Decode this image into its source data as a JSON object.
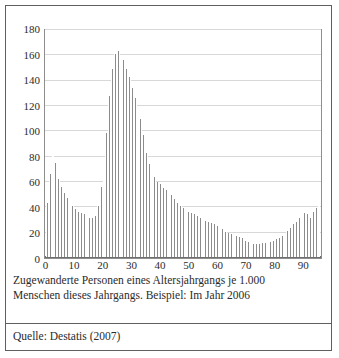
{
  "figure": {
    "caption_lines": [
      "Zugewanderte Personen eines Altersjahrgangs je 1.000",
      "Menschen dieses Jahrgangs. Beispiel: Im Jahr 2006"
    ],
    "source": "Quelle: Destatis (2007)"
  },
  "colors": {
    "bar_fill": "#8c8c8c",
    "grid": "#d8d8d8",
    "frame": "#8e8e8e",
    "outer_border": "#5f5f5f",
    "text": "#2b2b2b",
    "background": "#ffffff"
  },
  "chart_data": {
    "type": "bar",
    "title": "",
    "subtitle": "",
    "xlabel": "",
    "ylabel": "",
    "xlim": [
      -1,
      97
    ],
    "ylim": [
      0,
      180
    ],
    "grid": true,
    "legend": "none",
    "y_ticks": [
      0,
      20,
      40,
      60,
      80,
      100,
      120,
      140,
      160,
      180
    ],
    "x_ticks": [
      0,
      10,
      20,
      30,
      40,
      50,
      60,
      70,
      80,
      90
    ],
    "annotations": [],
    "categories": [
      0,
      1,
      2,
      3,
      4,
      5,
      6,
      7,
      8,
      9,
      10,
      11,
      12,
      13,
      14,
      15,
      16,
      17,
      18,
      19,
      20,
      21,
      22,
      23,
      24,
      25,
      26,
      27,
      28,
      29,
      30,
      31,
      32,
      33,
      34,
      35,
      36,
      37,
      38,
      39,
      40,
      41,
      42,
      43,
      44,
      45,
      46,
      47,
      48,
      49,
      50,
      51,
      52,
      53,
      54,
      55,
      56,
      57,
      58,
      59,
      60,
      61,
      62,
      63,
      64,
      65,
      66,
      67,
      68,
      69,
      70,
      71,
      72,
      73,
      74,
      75,
      76,
      77,
      78,
      79,
      80,
      81,
      82,
      83,
      84,
      85,
      86,
      87,
      88,
      89,
      90,
      91,
      92,
      93,
      94,
      95,
      96
    ],
    "values": [
      43,
      66,
      86,
      75,
      62,
      56,
      51,
      47,
      44,
      41,
      38,
      36,
      35,
      34,
      32,
      31,
      31,
      33,
      41,
      56,
      62,
      99,
      128,
      150,
      162,
      164,
      160,
      157,
      150,
      143,
      135,
      127,
      120,
      110,
      97,
      83,
      74,
      68,
      64,
      60,
      58,
      55,
      53,
      51,
      49,
      46,
      43,
      41,
      39,
      38,
      36,
      35,
      34,
      33,
      31,
      30,
      29,
      28,
      27,
      26,
      25,
      24,
      22,
      20,
      19,
      18,
      18,
      17,
      16,
      15,
      13,
      12,
      11,
      10,
      10,
      10,
      11,
      11,
      12,
      12,
      13,
      14,
      15,
      17,
      19,
      21,
      23,
      26,
      28,
      31,
      33,
      35,
      34,
      31,
      36,
      39,
      43
    ]
  }
}
